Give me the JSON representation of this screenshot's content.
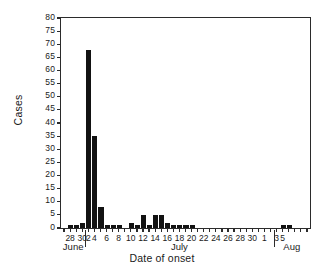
{
  "chart_data": {
    "type": "bar",
    "title": "",
    "xlabel": "Date of onset",
    "ylabel": "Cases",
    "ylim": [
      0,
      80
    ],
    "ytick_step": 5,
    "yticks": [
      0,
      5,
      10,
      15,
      20,
      25,
      30,
      35,
      40,
      45,
      50,
      55,
      60,
      65,
      70,
      75,
      80
    ],
    "grid": false,
    "legend": null,
    "bar_color": "#121212",
    "axis_color": "#2b2b2b",
    "background": "#ffffff",
    "xtick_labels": [
      "28",
      "30",
      "2",
      "4",
      "6",
      "8",
      "10",
      "12",
      "14",
      "16",
      "18",
      "20",
      "22",
      "24",
      "26",
      "28",
      "30",
      "1",
      "3",
      "5"
    ],
    "month_labels": [
      "June",
      "July",
      "Aug"
    ],
    "categories": [
      "Jun 27",
      "Jun 28",
      "Jun 29",
      "Jun 30",
      "Jul 1",
      "Jul 2",
      "Jul 3",
      "Jul 4",
      "Jul 5",
      "Jul 6",
      "Jul 7",
      "Jul 8",
      "Jul 9",
      "Jul 10",
      "Jul 11",
      "Jul 12",
      "Jul 13",
      "Jul 14",
      "Jul 15",
      "Jul 16",
      "Jul 17",
      "Jul 18",
      "Jul 19",
      "Jul 20",
      "Jul 21",
      "Jul 22",
      "Jul 23",
      "Jul 24",
      "Jul 25",
      "Jul 26",
      "Jul 27",
      "Jul 28",
      "Jul 29",
      "Jul 30",
      "Jul 31",
      "Aug 1",
      "Aug 2",
      "Aug 3",
      "Aug 4",
      "Aug 5",
      "Aug 6"
    ],
    "values": [
      0,
      1,
      1,
      2,
      68,
      35,
      8,
      1,
      1,
      1,
      0,
      2,
      1,
      5,
      1,
      5,
      5,
      2,
      1,
      1,
      1,
      1,
      0,
      0,
      0,
      0,
      0,
      0,
      0,
      0,
      0,
      0,
      0,
      0,
      0,
      0,
      1,
      1,
      0,
      0,
      0
    ]
  },
  "figure": {
    "ylabel_text": "Cases",
    "xlabel_text": "Date of onset"
  }
}
